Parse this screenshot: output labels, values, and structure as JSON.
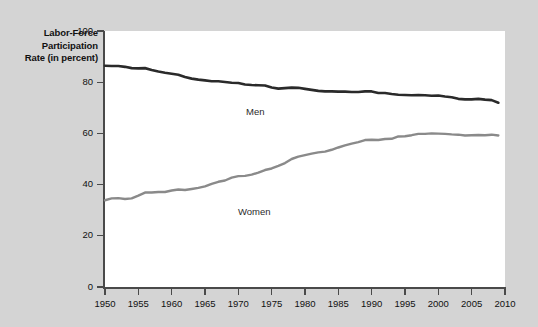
{
  "chart_data": {
    "type": "line",
    "title": "",
    "ylabel": "Labor-Force Participation Rate (in percent)",
    "ylabel_lines": [
      "Labor-Force",
      "Participation",
      "Rate (in percent)"
    ],
    "xlabel": "",
    "xlim": [
      1950,
      2010
    ],
    "ylim": [
      0,
      100
    ],
    "grid": false,
    "legend_position": "inline-annotations",
    "xticks": [
      1950,
      1955,
      1960,
      1965,
      1970,
      1975,
      1980,
      1985,
      1990,
      1995,
      2000,
      2005,
      2010
    ],
    "xtick_labels": [
      "1950",
      "1955",
      "1960",
      "1965",
      "1970",
      "1975",
      "1980",
      "1985",
      "1990",
      "1995",
      "2000",
      "2005",
      "2010"
    ],
    "yticks": [
      0,
      20,
      40,
      60,
      80,
      100
    ],
    "ytick_labels": [
      "0",
      "20",
      "40",
      "60",
      "80",
      "100"
    ],
    "x": [
      1950,
      1951,
      1952,
      1953,
      1954,
      1955,
      1956,
      1957,
      1958,
      1959,
      1960,
      1961,
      1962,
      1963,
      1964,
      1965,
      1966,
      1967,
      1968,
      1969,
      1970,
      1971,
      1972,
      1973,
      1974,
      1975,
      1976,
      1977,
      1978,
      1979,
      1980,
      1981,
      1982,
      1983,
      1984,
      1985,
      1986,
      1987,
      1988,
      1989,
      1990,
      1991,
      1992,
      1993,
      1994,
      1995,
      1996,
      1997,
      1998,
      1999,
      2000,
      2001,
      2002,
      2003,
      2004,
      2005,
      2006,
      2007,
      2008,
      2009
    ],
    "series": [
      {
        "name": "Men",
        "color": "#2a2a2a",
        "label_x": 1978,
        "label_y": 84,
        "values": [
          86.4,
          86.3,
          86.3,
          86.0,
          85.5,
          85.4,
          85.5,
          84.8,
          84.2,
          83.7,
          83.3,
          82.9,
          82.0,
          81.4,
          81.0,
          80.7,
          80.4,
          80.4,
          80.1,
          79.8,
          79.7,
          79.1,
          78.9,
          78.8,
          78.7,
          77.9,
          77.5,
          77.7,
          77.9,
          77.8,
          77.4,
          77.0,
          76.6,
          76.4,
          76.4,
          76.3,
          76.3,
          76.2,
          76.2,
          76.4,
          76.4,
          75.8,
          75.8,
          75.4,
          75.1,
          75.0,
          74.9,
          75.0,
          74.9,
          74.7,
          74.8,
          74.4,
          74.1,
          73.5,
          73.3,
          73.3,
          73.5,
          73.2,
          73.0,
          72.0
        ]
      },
      {
        "name": "Women",
        "color": "#8a8a8a",
        "label_x": 1977,
        "label_y": 39,
        "values": [
          33.9,
          34.6,
          34.7,
          34.4,
          34.6,
          35.7,
          36.9,
          36.9,
          37.1,
          37.1,
          37.7,
          38.1,
          37.9,
          38.3,
          38.7,
          39.3,
          40.3,
          41.1,
          41.6,
          42.7,
          43.3,
          43.4,
          43.9,
          44.7,
          45.7,
          46.3,
          47.3,
          48.4,
          50.0,
          50.9,
          51.5,
          52.1,
          52.6,
          52.9,
          53.6,
          54.5,
          55.3,
          56.0,
          56.6,
          57.4,
          57.5,
          57.4,
          57.8,
          57.9,
          58.8,
          58.9,
          59.3,
          59.8,
          59.8,
          60.0,
          59.9,
          59.8,
          59.6,
          59.5,
          59.2,
          59.3,
          59.4,
          59.3,
          59.5,
          59.2
        ]
      }
    ]
  }
}
